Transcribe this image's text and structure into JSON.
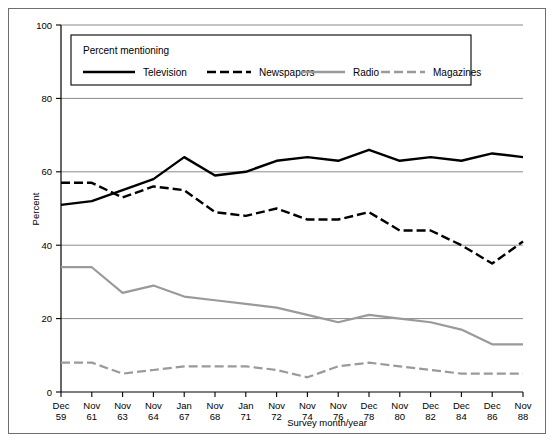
{
  "figure": {
    "axis_y_label": "Percent",
    "axis_x_label": "Survey month/year",
    "legend_title": "Percent mentioning"
  },
  "chart_data": {
    "type": "line",
    "title": "",
    "xlabel": "Survey month/year",
    "ylabel": "Percent",
    "ylim": [
      0,
      100
    ],
    "yticks": [
      0,
      20,
      40,
      60,
      80,
      100
    ],
    "grid": true,
    "legend_position": "top-inside",
    "legend_title": "Percent mentioning",
    "categories": [
      "Dec 59",
      "Nov 61",
      "Nov 63",
      "Nov 64",
      "Jan 67",
      "Nov 68",
      "Jan 71",
      "Nov 72",
      "Nov 74",
      "Nov 76",
      "Dec 78",
      "Nov 80",
      "Dec 82",
      "Dec 84",
      "Dec 86",
      "Nov 88"
    ],
    "tick_labels_month": [
      "Dec",
      "Nov",
      "Nov",
      "Nov",
      "Jan",
      "Nov",
      "Jan",
      "Nov",
      "Nov",
      "Nov",
      "Dec",
      "Nov",
      "Dec",
      "Dec",
      "Dec",
      "Nov"
    ],
    "tick_labels_year": [
      "59",
      "61",
      "63",
      "64",
      "67",
      "68",
      "71",
      "72",
      "74",
      "76",
      "78",
      "80",
      "82",
      "84",
      "86",
      "88"
    ],
    "series": [
      {
        "name": "Television",
        "style": "solid",
        "color": "#000000",
        "width": 2.4,
        "values": [
          51,
          52,
          55,
          58,
          64,
          59,
          60,
          63,
          64,
          63,
          66,
          63,
          64,
          63,
          65,
          64
        ]
      },
      {
        "name": "Newspapers",
        "style": "dashed",
        "color": "#000000",
        "width": 2.4,
        "values": [
          57,
          57,
          53,
          56,
          55,
          49,
          48,
          50,
          47,
          47,
          49,
          44,
          44,
          40,
          35,
          41
        ]
      },
      {
        "name": "Radio",
        "style": "solid",
        "color": "#9a9a9a",
        "width": 2.2,
        "values": [
          34,
          34,
          27,
          29,
          26,
          25,
          24,
          23,
          21,
          19,
          21,
          20,
          19,
          17,
          13,
          13
        ]
      },
      {
        "name": "Magazines",
        "style": "dashed",
        "color": "#9a9a9a",
        "width": 2.2,
        "values": [
          8,
          8,
          5,
          6,
          7,
          7,
          7,
          6,
          4,
          7,
          8,
          7,
          6,
          5,
          5,
          5
        ]
      }
    ]
  },
  "legend": {
    "items": [
      {
        "label": "Television",
        "style": "solid",
        "color": "#000000"
      },
      {
        "label": "Newspapers",
        "style": "dashed",
        "color": "#000000"
      },
      {
        "label": "Radio",
        "style": "solid",
        "color": "#9a9a9a"
      },
      {
        "label": "Magazines",
        "style": "dashed",
        "color": "#9a9a9a"
      }
    ]
  }
}
